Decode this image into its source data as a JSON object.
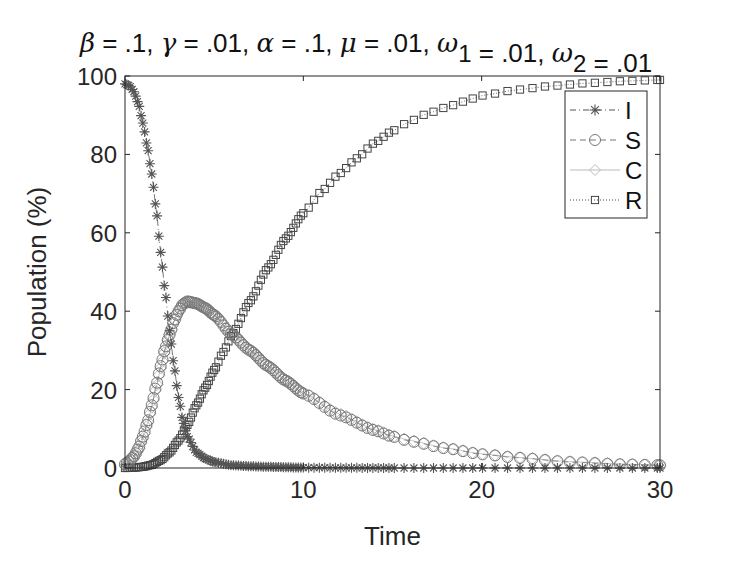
{
  "chart_data": {
    "type": "line",
    "title": "β = .1, γ = .01, α = .1, μ = .01, ω1 = .01, ω2 = .01",
    "title_parts": [
      {
        "text": "β",
        "greek": true
      },
      {
        "text": " = .1, "
      },
      {
        "text": "γ",
        "greek": true
      },
      {
        "text": " = .01, "
      },
      {
        "text": "α",
        "greek": true
      },
      {
        "text": " = .1, "
      },
      {
        "text": "μ",
        "greek": true
      },
      {
        "text": " = .01, "
      },
      {
        "text": "ω",
        "greek": true
      },
      {
        "text": "1",
        "sub": true
      },
      {
        "text": " = .01, "
      },
      {
        "text": "ω",
        "greek": true
      },
      {
        "text": "2",
        "sub": true
      },
      {
        "text": " = .01"
      }
    ],
    "xlabel": "Time",
    "ylabel": "Population (%)",
    "xlim": [
      0,
      30
    ],
    "ylim": [
      0,
      100
    ],
    "xticks": [
      0,
      10,
      20,
      30
    ],
    "yticks": [
      0,
      20,
      40,
      60,
      80,
      100
    ],
    "grid": false,
    "legend_position": "upper right",
    "series": [
      {
        "name": "I",
        "marker": "asterisk",
        "line": "dash-dot",
        "color": "#555555",
        "points": [
          [
            0,
            98
          ],
          [
            0.25,
            97.5
          ],
          [
            0.5,
            96
          ],
          [
            0.75,
            93
          ],
          [
            1,
            88
          ],
          [
            1.25,
            82
          ],
          [
            1.5,
            75
          ],
          [
            1.75,
            66
          ],
          [
            2,
            55
          ],
          [
            2.25,
            45
          ],
          [
            2.5,
            35
          ],
          [
            2.75,
            26
          ],
          [
            3,
            18
          ],
          [
            3.25,
            12
          ],
          [
            3.5,
            8
          ],
          [
            4,
            4
          ],
          [
            4.5,
            2.4
          ],
          [
            5,
            1.5
          ],
          [
            6,
            0.7
          ],
          [
            7,
            0.45
          ],
          [
            8,
            0.3
          ],
          [
            10,
            0.1
          ],
          [
            12,
            0.05
          ],
          [
            15,
            0
          ],
          [
            20,
            0
          ],
          [
            25,
            0
          ],
          [
            30,
            0
          ]
        ]
      },
      {
        "name": "S",
        "marker": "circle",
        "line": "dashed",
        "color": "#777777",
        "points": [
          [
            0,
            1
          ],
          [
            0.25,
            1.8
          ],
          [
            0.5,
            3
          ],
          [
            0.75,
            5
          ],
          [
            1,
            8
          ],
          [
            1.25,
            11.5
          ],
          [
            1.5,
            16
          ],
          [
            1.75,
            21
          ],
          [
            2,
            26
          ],
          [
            2.25,
            30.5
          ],
          [
            2.5,
            34
          ],
          [
            2.75,
            37.5
          ],
          [
            3,
            40
          ],
          [
            3.25,
            41.8
          ],
          [
            3.5,
            42.5
          ],
          [
            4,
            42
          ],
          [
            4.5,
            40.8
          ],
          [
            5,
            39
          ],
          [
            6,
            34
          ],
          [
            7,
            30
          ],
          [
            8,
            26
          ],
          [
            9,
            22.3
          ],
          [
            10,
            19
          ],
          [
            12,
            13.5
          ],
          [
            14,
            9.6
          ],
          [
            15,
            8
          ],
          [
            16,
            6.8
          ],
          [
            18,
            5
          ],
          [
            20,
            3.5
          ],
          [
            22,
            2.6
          ],
          [
            25,
            1.5
          ],
          [
            28,
            0.9
          ],
          [
            30,
            0.7
          ]
        ]
      },
      {
        "name": "C",
        "marker": "diamond",
        "line": "solid",
        "color": "#bbbbbb",
        "points": [
          [
            0,
            0.5
          ],
          [
            0.25,
            1.2
          ],
          [
            0.5,
            2.5
          ],
          [
            0.75,
            4.5
          ],
          [
            1,
            7.5
          ],
          [
            1.25,
            11
          ],
          [
            1.5,
            15.5
          ],
          [
            1.75,
            20.5
          ],
          [
            2,
            25.5
          ],
          [
            2.25,
            30
          ],
          [
            2.5,
            34
          ],
          [
            2.75,
            37.5
          ],
          [
            3,
            40
          ],
          [
            3.25,
            41.8
          ],
          [
            3.5,
            42.3
          ],
          [
            4,
            42
          ],
          [
            4.5,
            40.8
          ],
          [
            5,
            39
          ],
          [
            6,
            34.5
          ],
          [
            7,
            30.2
          ],
          [
            8,
            26.2
          ],
          [
            9,
            22.5
          ],
          [
            10,
            19.2
          ],
          [
            12,
            13.8
          ],
          [
            14,
            9.8
          ],
          [
            15,
            8.2
          ],
          [
            16,
            7
          ],
          [
            18,
            5.1
          ],
          [
            20,
            3.6
          ],
          [
            22,
            2.7
          ],
          [
            25,
            1.6
          ],
          [
            28,
            1
          ],
          [
            30,
            0.7
          ]
        ]
      },
      {
        "name": "R",
        "marker": "square",
        "line": "dotted",
        "color": "#444444",
        "points": [
          [
            0,
            0
          ],
          [
            0.5,
            0.1
          ],
          [
            1,
            0.3
          ],
          [
            1.5,
            0.8
          ],
          [
            2,
            2
          ],
          [
            2.5,
            4
          ],
          [
            3,
            7
          ],
          [
            3.5,
            11
          ],
          [
            4,
            16
          ],
          [
            4.5,
            20.5
          ],
          [
            5,
            25
          ],
          [
            5.5,
            29.5
          ],
          [
            6,
            34
          ],
          [
            7,
            42.5
          ],
          [
            8,
            51
          ],
          [
            9,
            58.5
          ],
          [
            10,
            65
          ],
          [
            11,
            70.5
          ],
          [
            12,
            75
          ],
          [
            13,
            79
          ],
          [
            14,
            83
          ],
          [
            15,
            86
          ],
          [
            16,
            88.5
          ],
          [
            17,
            90.5
          ],
          [
            18,
            92
          ],
          [
            19,
            93.5
          ],
          [
            20,
            95
          ],
          [
            22,
            96.5
          ],
          [
            24,
            97.5
          ],
          [
            26,
            98.2
          ],
          [
            28,
            98.7
          ],
          [
            30,
            99
          ]
        ]
      }
    ]
  },
  "legend": {
    "items": [
      {
        "label": "I"
      },
      {
        "label": "S"
      },
      {
        "label": "C"
      },
      {
        "label": "R"
      }
    ]
  },
  "axes": {
    "xlabel": "Time",
    "ylabel": "Population (%)",
    "xtick_labels": [
      "0",
      "10",
      "20",
      "30"
    ],
    "ytick_labels": [
      "0",
      "20",
      "40",
      "60",
      "80",
      "100"
    ]
  }
}
